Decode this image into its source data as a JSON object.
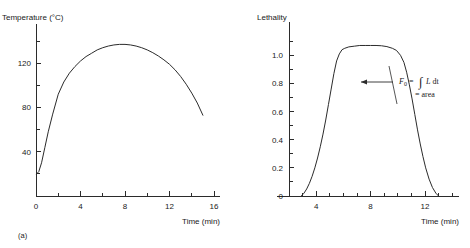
{
  "figure": {
    "caption": "(a)",
    "panels": [
      "temperature-vs-time",
      "lethality-vs-time"
    ]
  },
  "annotation": {
    "f0_symbol": "F",
    "f0_subscript": "0",
    "equals": "=",
    "integral_glyph": "∫",
    "integrand": "L",
    "differential": "dt",
    "second_line": "= area"
  },
  "chart_data": [
    {
      "type": "line",
      "id": "temperature-vs-time",
      "title": "",
      "ylabel": "Temperature (°C)",
      "xlabel": "Time (min)",
      "xlim": [
        0,
        16
      ],
      "ylim": [
        0,
        150
      ],
      "grid": false,
      "legend": "none",
      "x_ticks_major": [
        0,
        4,
        8,
        12,
        16
      ],
      "x_tick_labels": [
        "0",
        "4",
        "8",
        "12",
        "16"
      ],
      "x_ticks_minor": [
        2,
        6,
        10,
        14
      ],
      "y_ticks_major": [
        0,
        40,
        80,
        120
      ],
      "y_tick_labels": [
        "0",
        "40",
        "80",
        "120"
      ],
      "y_ticks_minor": [
        20,
        60,
        100,
        140
      ],
      "series": [
        {
          "name": "Temperature",
          "x": [
            0.05,
            0.25,
            0.5,
            0.8,
            1.1,
            1.5,
            2.0,
            2.5,
            3.0,
            3.5,
            4.0,
            4.5,
            5.0,
            5.5,
            6.0,
            6.5,
            7.0,
            7.5,
            8.0,
            8.5,
            9.0,
            9.5,
            10.0,
            10.5,
            11.0,
            11.5,
            12.0,
            12.5,
            13.0,
            13.5,
            14.0,
            14.5,
            15.0
          ],
          "y": [
            20,
            22,
            30,
            44,
            58,
            74,
            92,
            103,
            111,
            117,
            122,
            126,
            129,
            132,
            134,
            135.5,
            136.5,
            137,
            137,
            136.5,
            135.5,
            134,
            132,
            129.5,
            126.5,
            123,
            119,
            114,
            108,
            101,
            93,
            84,
            73
          ]
        }
      ]
    },
    {
      "type": "line",
      "id": "lethality-vs-time",
      "title": "",
      "ylabel": "Lethality",
      "xlabel": "Time (min)",
      "xlim": [
        2,
        14.5
      ],
      "ylim": [
        0,
        1.18
      ],
      "grid": false,
      "legend": "none",
      "x_ticks_major": [
        4,
        8,
        12
      ],
      "x_tick_labels": [
        "4",
        "8",
        "12"
      ],
      "x_ticks_minor": [
        3,
        5,
        6,
        7,
        9,
        10,
        11,
        13,
        14
      ],
      "y_ticks_major": [
        0,
        0.2,
        0.4,
        0.6,
        0.8,
        1.0
      ],
      "y_tick_labels": [
        "0",
        "0.2",
        "0.4",
        "0.6",
        "0.8",
        "1.0"
      ],
      "y_ticks_minor": [
        0.1,
        0.3,
        0.5,
        0.7,
        0.9,
        1.1
      ],
      "series": [
        {
          "name": "Lethality",
          "x": [
            2.9,
            3.1,
            3.3,
            3.5,
            3.7,
            3.9,
            4.1,
            4.3,
            4.5,
            4.7,
            4.9,
            5.1,
            5.3,
            5.5,
            5.7,
            5.9,
            6.1,
            6.4,
            6.8,
            7.2,
            7.6,
            8.0,
            8.4,
            8.8,
            9.2,
            9.6,
            9.9,
            10.2,
            10.45,
            10.65,
            10.85,
            11.05,
            11.25,
            11.45,
            11.65,
            11.85,
            12.05,
            12.3,
            12.55,
            12.8,
            13.0
          ],
          "y": [
            0,
            0.02,
            0.05,
            0.09,
            0.14,
            0.2,
            0.27,
            0.35,
            0.44,
            0.54,
            0.65,
            0.76,
            0.87,
            0.96,
            1.01,
            1.04,
            1.05,
            1.06,
            1.065,
            1.07,
            1.07,
            1.07,
            1.07,
            1.068,
            1.062,
            1.05,
            1.035,
            1.0,
            0.95,
            0.88,
            0.79,
            0.69,
            0.58,
            0.47,
            0.37,
            0.28,
            0.2,
            0.12,
            0.06,
            0.02,
            0
          ]
        }
      ]
    }
  ]
}
